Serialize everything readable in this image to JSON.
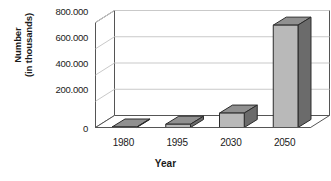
{
  "chart_data": {
    "type": "bar",
    "title": "",
    "subtitle": "",
    "xlabel": "Year",
    "ylabel": "Number (in thousands)",
    "ylabel_lines": [
      "Number",
      "(in thousands)"
    ],
    "categories": [
      "1980",
      "1995",
      "2030",
      "2050"
    ],
    "values": [
      3,
      25,
      110,
      780
    ],
    "value_labels": [
      "",
      "",
      "",
      ""
    ],
    "ylim": [
      0,
      800000
    ],
    "ytick_values": [
      0,
      200000,
      400000,
      600000,
      800000
    ],
    "ytick_labels": [
      "0",
      "200.000",
      "400.000",
      "600.000",
      "800.000"
    ],
    "units": "thousands",
    "grid": true,
    "grid_axis": "y",
    "legend": false,
    "legend_position": "none",
    "three_d": true,
    "series": [
      {
        "name": "Number (in thousands)",
        "values": [
          3,
          25,
          110,
          780
        ]
      }
    ],
    "colors": {
      "bar_front": "#b9b9b9",
      "bar_side": "#6b6b6b",
      "bar_top": "#909090",
      "bar_outline": "#2b2b2b",
      "grid": "#c9c9c9",
      "axis": "#555555",
      "floor": "#ffffff",
      "text": "#1a1a1a",
      "background": "#ffffff"
    }
  },
  "axes": {
    "y_title_line1": "Number",
    "y_title_line2": "(in thousands)",
    "x_title": "Year"
  }
}
